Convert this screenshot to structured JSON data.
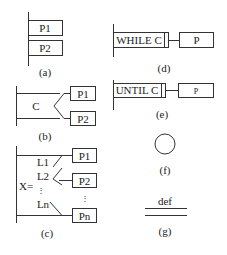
{
  "figures": {
    "a": {
      "caption": "(a)",
      "type": "sequence",
      "blocks": [
        "P1",
        "P2"
      ]
    },
    "b": {
      "caption": "(b)",
      "type": "selection",
      "condition": "C",
      "branches": [
        "P1",
        "P2"
      ]
    },
    "c": {
      "caption": "(c)",
      "type": "case",
      "selector": "X=",
      "labels": [
        "L1",
        "L2",
        "⋮",
        "Ln"
      ],
      "branches": [
        "P1",
        "P2",
        "⋮",
        "Pn"
      ]
    },
    "d": {
      "caption": "(d)",
      "type": "while-loop",
      "condition": "WHILE C",
      "body": "P"
    },
    "e": {
      "caption": "(e)",
      "type": "until-loop",
      "condition": "UNTIL C",
      "body": "P"
    },
    "f": {
      "caption": "(f)",
      "type": "circle"
    },
    "g": {
      "caption": "(g)",
      "type": "definition",
      "label": "def"
    }
  }
}
